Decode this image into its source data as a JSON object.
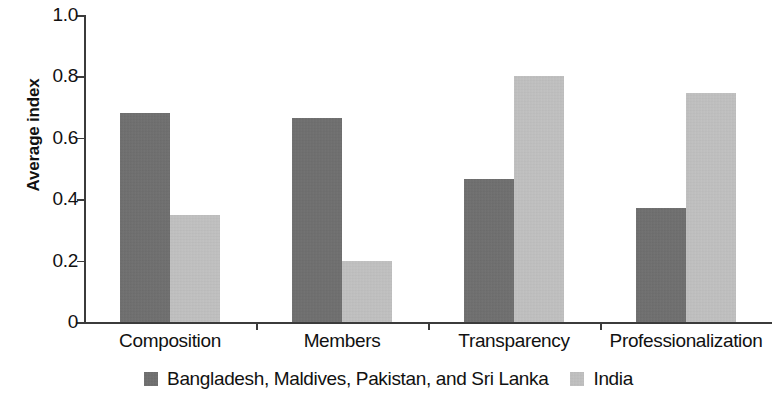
{
  "chart_data": {
    "type": "bar",
    "title": "",
    "subtitle": "",
    "xlabel": "",
    "ylabel": "Average index",
    "ylim": [
      0,
      1.0
    ],
    "ytick_labels": [
      "0",
      "0.2",
      "0.4",
      "0.6",
      "0.8",
      "1.0"
    ],
    "ytick_values": [
      0,
      0.2,
      0.4,
      0.6,
      0.8,
      1.0
    ],
    "grid": false,
    "legend_position": "bottom-center",
    "categories": [
      "Composition",
      "Members",
      "Transparency",
      "Professionalization"
    ],
    "series": [
      {
        "name": "Bangladesh, Maldives, Pakistan, and Sri Lanka",
        "color": "#6e6e6e",
        "values": [
          0.68,
          0.665,
          0.465,
          0.37
        ]
      },
      {
        "name": "India",
        "color": "#c2c2c2",
        "values": [
          0.35,
          0.2,
          0.8,
          0.745
        ]
      }
    ]
  },
  "axis": {
    "y_title": "Average index",
    "axis_color": "#3b3b3b"
  }
}
